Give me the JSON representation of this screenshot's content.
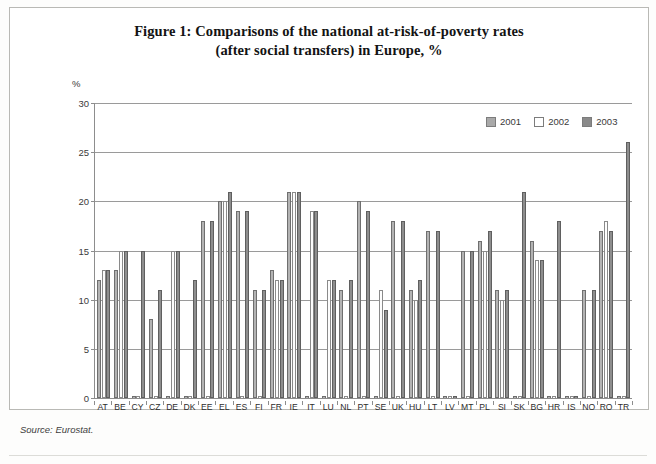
{
  "figure": {
    "title_line1": "Figure 1: Comparisons of the national at-risk-of-poverty rates",
    "title_line2": "(after social transfers) in Europe, %",
    "unit_label": "%",
    "source": "Source: Eurostat."
  },
  "legend": {
    "position": "top-right",
    "items": [
      {
        "label": "2001",
        "color": "#b3b3b3",
        "icon": "legend-swatch-2001"
      },
      {
        "label": "2002",
        "color": "#ffffff",
        "icon": "legend-swatch-2002"
      },
      {
        "label": "2003",
        "color": "#8e8e8e",
        "icon": "legend-swatch-2003"
      }
    ]
  },
  "chart_data": {
    "type": "bar",
    "title": "Figure 1: Comparisons of the national at-risk-of-poverty rates (after social transfers) in Europe, %",
    "xlabel": "",
    "ylabel": "%",
    "ylim": [
      0,
      30
    ],
    "yticks": [
      0,
      5,
      10,
      15,
      20,
      25,
      30
    ],
    "grid": true,
    "legend_position": "top-right",
    "categories": [
      "AT",
      "BE",
      "CY",
      "CZ",
      "DE",
      "DK",
      "EE",
      "EL",
      "ES",
      "FI",
      "FR",
      "IE",
      "IT",
      "LU",
      "NL",
      "PT",
      "SE",
      "UK",
      "HU",
      "LT",
      "LV",
      "MT",
      "PL",
      "SI",
      "SK",
      "BG",
      "HR",
      "IS",
      "NO",
      "RO",
      "TR"
    ],
    "series": [
      {
        "name": "2001",
        "color": "#b3b3b3",
        "values": [
          12,
          13,
          null,
          8,
          null,
          null,
          18,
          20,
          19,
          11,
          13,
          21,
          null,
          null,
          11,
          20,
          null,
          18,
          11,
          17,
          null,
          15,
          16,
          11,
          null,
          16,
          null,
          null,
          11,
          17,
          null
        ]
      },
      {
        "name": "2002",
        "color": "#ffffff",
        "values": [
          13,
          15,
          null,
          null,
          15,
          null,
          null,
          20,
          null,
          null,
          12,
          21,
          19,
          12,
          null,
          null,
          11,
          null,
          10,
          null,
          null,
          null,
          15,
          10,
          null,
          14,
          null,
          null,
          null,
          18,
          null
        ]
      },
      {
        "name": "2003",
        "color": "#8e8e8e",
        "values": [
          13,
          15,
          15,
          11,
          15,
          12,
          18,
          21,
          19,
          11,
          12,
          21,
          19,
          12,
          12,
          19,
          9,
          18,
          12,
          17,
          null,
          15,
          17,
          11,
          21,
          14,
          18,
          null,
          11,
          17,
          26
        ]
      }
    ]
  }
}
